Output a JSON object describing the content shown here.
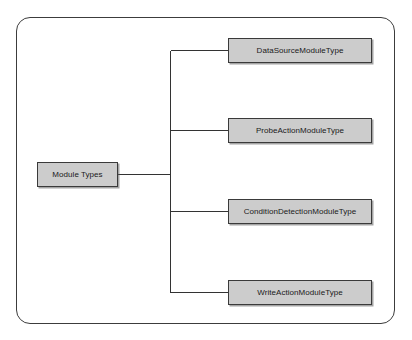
{
  "diagram": {
    "type": "tree",
    "orientation": "left-to-right",
    "frame": {
      "shape": "rounded-rectangle",
      "border_color": "#3c3c3c",
      "background_color": "#ffffff"
    },
    "node_style": {
      "fill_color": "#cccccc",
      "border_color": "#3a3a3a",
      "text_color": "#1a1a1a",
      "shadow_color": "#5a5a5a"
    },
    "connector_color": "#333333",
    "root": {
      "id": "module-types",
      "label": "Module Types"
    },
    "children": [
      {
        "id": "data-source-module-type",
        "label": "DataSourceModuleType"
      },
      {
        "id": "probe-action-module-type",
        "label": "ProbeActionModuleType"
      },
      {
        "id": "condition-detection-module-type",
        "label": "ConditionDetectionModuleType"
      },
      {
        "id": "write-action-module-type",
        "label": "WriteActionModuleType"
      }
    ]
  }
}
